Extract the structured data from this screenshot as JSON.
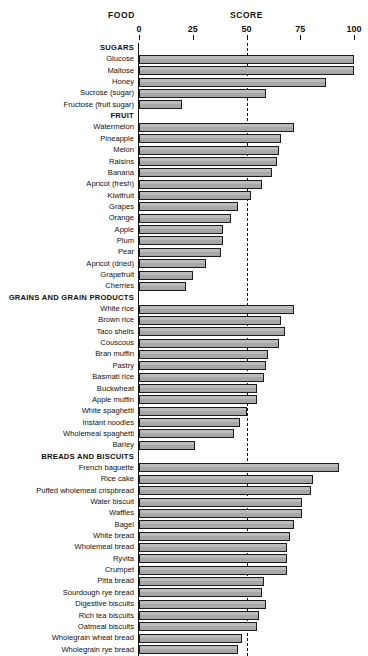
{
  "header": {
    "food_label": "FOOD",
    "score_label": "SCORE"
  },
  "axis": {
    "min": 0,
    "max": 100,
    "ticks": [
      0,
      25,
      50,
      75,
      100
    ],
    "tick_labels": [
      "0",
      "25",
      "50",
      "75",
      "100"
    ],
    "midline_value": 50
  },
  "colors": {
    "bar_fill": "#a8a8a8",
    "bar_stroke": "#1b1b1b",
    "text": "#111111",
    "background": "#ffffff"
  },
  "chart_data": {
    "type": "bar",
    "orientation": "horizontal",
    "title": "",
    "xlabel": "SCORE",
    "ylabel": "FOOD",
    "xlim": [
      0,
      100
    ],
    "grid": false,
    "legend": "none",
    "annotations": [
      "dashed reference line at score 50"
    ],
    "groups": [
      {
        "name": "SUGARS",
        "categories": [
          "Glucose",
          "Maltose",
          "Honey",
          "Sucrose (sugar)",
          "Fructose (fruit sugar)"
        ],
        "values": [
          100,
          100,
          87,
          59,
          20
        ]
      },
      {
        "name": "FRUIT",
        "categories": [
          "Watermelon",
          "Pineapple",
          "Melon",
          "Raisins",
          "Banana",
          "Apricot (fresh)",
          "Kiwifruit",
          "Grapes",
          "Orange",
          "Apple",
          "Plum",
          "Pear",
          "Apricot (dried)",
          "Grapefruit",
          "Cherries"
        ],
        "values": [
          72,
          66,
          65,
          64,
          62,
          57,
          52,
          46,
          43,
          39,
          39,
          38,
          31,
          25,
          22
        ]
      },
      {
        "name": "GRAINS AND GRAIN PRODUCTS",
        "categories": [
          "White rice",
          "Brown rice",
          "Taco shells",
          "Couscous",
          "Bran muffin",
          "Pastry",
          "Basmati rice",
          "Buckwheat",
          "Apple muffin",
          "White spaghetti",
          "Instant noodles",
          "Wholemeal spaghetti",
          "Barley"
        ],
        "values": [
          72,
          66,
          68,
          65,
          60,
          59,
          58,
          55,
          55,
          50,
          47,
          44,
          26
        ]
      },
      {
        "name": "BREADS AND BISCUITS",
        "categories": [
          "French baguette",
          "Rice cake",
          "Puffed wholemeal crispbread",
          "Water biscuit",
          "Waffles",
          "Bagel",
          "White bread",
          "Wholemeal bread",
          "Ryvita",
          "Crumpet",
          "Pitta bread",
          "Sourdough rye bread",
          "Digestive biscuits",
          "Rich tea biscuits",
          "Oatmeal biscuits",
          "Wholegrain wheat bread",
          "Wholegrain rye bread"
        ],
        "values": [
          93,
          81,
          80,
          76,
          76,
          72,
          70,
          69,
          69,
          69,
          58,
          57,
          59,
          56,
          55,
          48,
          46
        ]
      }
    ]
  }
}
